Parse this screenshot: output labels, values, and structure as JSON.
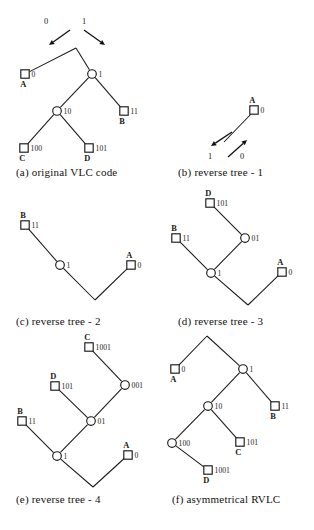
{
  "figure": {
    "node_shapes": {
      "leaf": "square",
      "internal": "circle"
    },
    "stroke_color": "#1a1a1a",
    "background_color": "#ffffff"
  },
  "panels": [
    {
      "id": "a",
      "caption": "(a) original VLC code",
      "caption_x": 16,
      "caption_y": 166,
      "origin_x": 0,
      "origin_y": 0,
      "width": 160,
      "height": 162,
      "nodes": [
        {
          "name": "root",
          "type": "root",
          "x": 76,
          "y": 48,
          "code": "",
          "symbol": ""
        },
        {
          "name": "leaf-a",
          "type": "leaf",
          "x": 25,
          "y": 74,
          "code": "0",
          "symbol": "A"
        },
        {
          "name": "int-1",
          "type": "circle",
          "x": 92,
          "y": 74,
          "code": "1",
          "symbol": ""
        },
        {
          "name": "int-10",
          "type": "circle",
          "x": 57,
          "y": 111,
          "code": "10",
          "symbol": ""
        },
        {
          "name": "leaf-b",
          "type": "leaf",
          "x": 124,
          "y": 111,
          "code": "11",
          "symbol": "B"
        },
        {
          "name": "leaf-c",
          "type": "leaf",
          "x": 24,
          "y": 148,
          "code": "100",
          "symbol": "C"
        },
        {
          "name": "leaf-d",
          "type": "leaf",
          "x": 89,
          "y": 148,
          "code": "101",
          "symbol": "D"
        }
      ],
      "edges": [
        [
          "root",
          "leaf-a"
        ],
        [
          "root",
          "int-1"
        ],
        [
          "int-1",
          "int-10"
        ],
        [
          "int-1",
          "leaf-b"
        ],
        [
          "int-10",
          "leaf-c"
        ],
        [
          "int-10",
          "leaf-d"
        ]
      ],
      "arrows": [
        {
          "name": "arrow-0",
          "label": "0",
          "from_x": 70,
          "from_y": 30,
          "to_x": 49,
          "to_y": 45,
          "label_x": 44,
          "label_y": 24
        },
        {
          "name": "arrow-1",
          "label": "1",
          "from_x": 84,
          "from_y": 30,
          "to_x": 105,
          "to_y": 45,
          "label_x": 82,
          "label_y": 24
        }
      ]
    },
    {
      "id": "b",
      "caption": "(b) reverse tree - 1",
      "caption_x": 178,
      "caption_y": 166,
      "origin_x": 0,
      "origin_y": 0,
      "width": 160,
      "height": 162,
      "nodes": [
        {
          "name": "leaf-a",
          "type": "leaf",
          "x": 254,
          "y": 110,
          "code": "0",
          "symbol": "A"
        }
      ],
      "edges": [],
      "free_lines": [
        {
          "name": "reverse-stem",
          "x1": 252,
          "y1": 113,
          "x2": 224,
          "y2": 142
        }
      ],
      "arrows": [
        {
          "name": "arrow-1",
          "label": "1",
          "from_x": 232,
          "from_y": 132,
          "to_x": 211,
          "to_y": 146,
          "label_x": 208,
          "label_y": 159
        },
        {
          "name": "arrow-0",
          "label": "0",
          "from_x": 228,
          "from_y": 157,
          "to_x": 247,
          "to_y": 140,
          "label_x": 240,
          "label_y": 159
        }
      ]
    },
    {
      "id": "c",
      "caption": "(c) reverse tree - 2",
      "caption_x": 16,
      "caption_y": 315,
      "origin_x": 0,
      "origin_y": 0,
      "width": 160,
      "height": 130,
      "nodes": [
        {
          "name": "leaf-b",
          "type": "leaf",
          "x": 25,
          "y": 225,
          "code": "11",
          "symbol": "B"
        },
        {
          "name": "int-1",
          "type": "circle",
          "x": 60,
          "y": 265,
          "code": "1",
          "symbol": ""
        },
        {
          "name": "root",
          "type": "root",
          "x": 95,
          "y": 300,
          "code": "",
          "symbol": ""
        },
        {
          "name": "leaf-a",
          "type": "leaf",
          "x": 131,
          "y": 265,
          "code": "0",
          "symbol": "A"
        }
      ],
      "edges": [
        [
          "leaf-b",
          "int-1"
        ],
        [
          "int-1",
          "root"
        ],
        [
          "root",
          "leaf-a"
        ]
      ]
    },
    {
      "id": "d",
      "caption": "(d) reverse tree - 3",
      "caption_x": 178,
      "caption_y": 315,
      "origin_x": 0,
      "origin_y": 0,
      "width": 160,
      "height": 130,
      "nodes": [
        {
          "name": "leaf-d",
          "type": "leaf",
          "x": 210,
          "y": 203,
          "code": "101",
          "symbol": "D"
        },
        {
          "name": "int-01",
          "type": "circle",
          "x": 245,
          "y": 238,
          "code": "01",
          "symbol": ""
        },
        {
          "name": "leaf-b",
          "type": "leaf",
          "x": 176,
          "y": 238,
          "code": "11",
          "symbol": "B"
        },
        {
          "name": "int-1",
          "type": "circle",
          "x": 211,
          "y": 273,
          "code": "1",
          "symbol": ""
        },
        {
          "name": "root",
          "type": "root",
          "x": 248,
          "y": 305,
          "code": "",
          "symbol": ""
        },
        {
          "name": "leaf-a",
          "type": "leaf",
          "x": 282,
          "y": 272,
          "code": "0",
          "symbol": "A"
        }
      ],
      "edges": [
        [
          "leaf-d",
          "int-01"
        ],
        [
          "int-01",
          "int-1"
        ],
        [
          "leaf-b",
          "int-1"
        ],
        [
          "int-1",
          "root"
        ],
        [
          "root",
          "leaf-a"
        ]
      ]
    },
    {
      "id": "e",
      "caption": "(e) reverse tree - 4",
      "caption_x": 16,
      "caption_y": 493,
      "origin_x": 0,
      "origin_y": 0,
      "width": 160,
      "height": 165,
      "nodes": [
        {
          "name": "leaf-c",
          "type": "leaf",
          "x": 89,
          "y": 347,
          "code": "1001",
          "symbol": "C"
        },
        {
          "name": "int-001",
          "type": "circle",
          "x": 125,
          "y": 385,
          "code": "001",
          "symbol": ""
        },
        {
          "name": "leaf-d",
          "type": "leaf",
          "x": 55,
          "y": 386,
          "code": "101",
          "symbol": "D"
        },
        {
          "name": "int-01",
          "type": "circle",
          "x": 91,
          "y": 421,
          "code": "01",
          "symbol": ""
        },
        {
          "name": "leaf-b",
          "type": "leaf",
          "x": 22,
          "y": 421,
          "code": "11",
          "symbol": "B"
        },
        {
          "name": "int-1",
          "type": "circle",
          "x": 57,
          "y": 456,
          "code": "1",
          "symbol": ""
        },
        {
          "name": "root",
          "type": "root",
          "x": 93,
          "y": 487,
          "code": "",
          "symbol": ""
        },
        {
          "name": "leaf-a",
          "type": "leaf",
          "x": 128,
          "y": 455,
          "code": "0",
          "symbol": "A"
        }
      ],
      "edges": [
        [
          "leaf-c",
          "int-001"
        ],
        [
          "int-001",
          "int-01"
        ],
        [
          "leaf-d",
          "int-01"
        ],
        [
          "int-01",
          "int-1"
        ],
        [
          "leaf-b",
          "int-1"
        ],
        [
          "int-1",
          "root"
        ],
        [
          "root",
          "leaf-a"
        ]
      ]
    },
    {
      "id": "f",
      "caption": "(f) asymmetrical RVLC",
      "caption_x": 172,
      "caption_y": 493,
      "origin_x": 0,
      "origin_y": 0,
      "width": 160,
      "height": 165,
      "nodes": [
        {
          "name": "root",
          "type": "root",
          "x": 207,
          "y": 336,
          "code": "",
          "symbol": ""
        },
        {
          "name": "leaf-a",
          "type": "leaf",
          "x": 175,
          "y": 369,
          "code": "0",
          "symbol": "A"
        },
        {
          "name": "int-1",
          "type": "circle",
          "x": 243,
          "y": 369,
          "code": "1",
          "symbol": ""
        },
        {
          "name": "int-10",
          "type": "circle",
          "x": 208,
          "y": 406,
          "code": "10",
          "symbol": ""
        },
        {
          "name": "leaf-b",
          "type": "leaf",
          "x": 275,
          "y": 406,
          "code": "11",
          "symbol": "B"
        },
        {
          "name": "int-100",
          "type": "circle",
          "x": 172,
          "y": 443,
          "code": "100",
          "symbol": ""
        },
        {
          "name": "leaf-c",
          "type": "leaf",
          "x": 240,
          "y": 442,
          "code": "101",
          "symbol": "C"
        },
        {
          "name": "leaf-d",
          "type": "leaf",
          "x": 208,
          "y": 470,
          "code": "1001",
          "symbol": "D"
        }
      ],
      "edges": [
        [
          "root",
          "leaf-a"
        ],
        [
          "root",
          "int-1"
        ],
        [
          "int-1",
          "int-10"
        ],
        [
          "int-1",
          "leaf-b"
        ],
        [
          "int-10",
          "int-100"
        ],
        [
          "int-10",
          "leaf-c"
        ],
        [
          "int-100",
          "leaf-d"
        ]
      ]
    }
  ],
  "code_table": {
    "symbols": [
      "A",
      "B",
      "C",
      "D"
    ],
    "original_vlc": [
      "0",
      "11",
      "100",
      "101"
    ],
    "asymmetrical_rvlc": [
      "0",
      "11",
      "101",
      "1001"
    ]
  }
}
